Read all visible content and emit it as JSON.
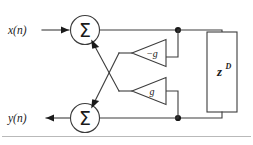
{
  "diagram": {
    "background_color": "#ffffff",
    "line_color": "#3c3c3c",
    "node_color": "#1a1a1a",
    "input": {
      "label": "x(n)",
      "arrow": "right-arrow-icon"
    },
    "output": {
      "label": "y(n)",
      "arrow": "left-arrow-icon"
    },
    "summers": [
      {
        "id": "top",
        "symbol": "Σ",
        "name": "top-summing-junction"
      },
      {
        "id": "bottom",
        "symbol": "Σ",
        "name": "bottom-summing-junction"
      }
    ],
    "gains": [
      {
        "id": "upper",
        "label": "−g",
        "name": "gain-block-negative-g"
      },
      {
        "id": "lower",
        "label": "g",
        "name": "gain-block-g"
      }
    ],
    "delay": {
      "base": "z",
      "exponent": "D",
      "name": "delay-block"
    },
    "junctions": [
      {
        "id": "top",
        "name": "junction-dot-top"
      },
      {
        "id": "bottom",
        "name": "junction-dot-bottom"
      }
    ]
  }
}
